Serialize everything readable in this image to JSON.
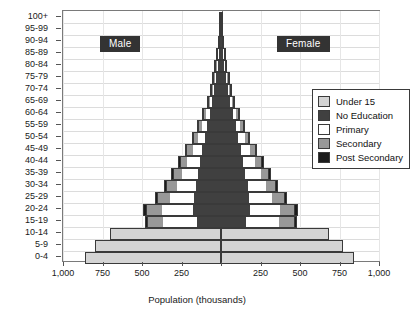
{
  "chart_data": {
    "type": "bar",
    "subtype": "population-pyramid-stacked",
    "title": "",
    "xlabel": "Population (thousands)",
    "ylabel": "",
    "grid": true,
    "legend_position": "upper-right-inside",
    "xlim": [
      -1000,
      1000
    ],
    "x_tick_values": [
      -1000,
      -750,
      -500,
      -250,
      0,
      250,
      500,
      750,
      1000
    ],
    "x_tick_labels": [
      "1,000",
      "750",
      "500",
      "250",
      "",
      "250",
      "500",
      "750",
      "1,000"
    ],
    "side_labels": {
      "left": "Male",
      "right": "Female"
    },
    "categories": [
      "0-4",
      "5-9",
      "10-14",
      "15-19",
      "20-24",
      "25-29",
      "30-34",
      "35-39",
      "40-44",
      "45-49",
      "50-54",
      "55-59",
      "60-64",
      "65-69",
      "70-74",
      "75-79",
      "80-84",
      "85-89",
      "90-94",
      "95-99",
      "100+"
    ],
    "series_order": [
      "Under 15",
      "No Education",
      "Primary",
      "Secondary",
      "Post Secondary"
    ],
    "colors": {
      "Under 15": "#d4d4d4",
      "No Education": "#404040",
      "Primary": "#ffffff",
      "Secondary": "#989898",
      "Post Secondary": "#1c1c1c",
      "outline": "#3a3a3a",
      "axis": "#6e6e6e",
      "grid": "#dcdcdc",
      "banner_bg": "#333333",
      "banner_text": "#ffffff"
    },
    "series": [
      {
        "name": "Under 15",
        "male": [
          862,
          795,
          700,
          0,
          0,
          0,
          0,
          0,
          0,
          0,
          0,
          0,
          0,
          0,
          0,
          0,
          0,
          0,
          0,
          0,
          0
        ],
        "female": [
          840,
          775,
          682,
          0,
          0,
          0,
          0,
          0,
          0,
          0,
          0,
          0,
          0,
          0,
          0,
          0,
          0,
          0,
          0,
          0,
          0
        ]
      },
      {
        "name": "No Education",
        "male": [
          0,
          0,
          0,
          150,
          178,
          172,
          160,
          148,
          135,
          120,
          104,
          88,
          72,
          56,
          42,
          30,
          19,
          11,
          5,
          2,
          1
        ],
        "female": [
          0,
          0,
          0,
          158,
          186,
          180,
          168,
          155,
          141,
          126,
          109,
          92,
          75,
          58,
          44,
          31,
          20,
          11,
          5,
          2,
          1
        ]
      },
      {
        "name": "Primary",
        "male": [
          0,
          0,
          0,
          216,
          196,
          148,
          120,
          100,
          78,
          60,
          44,
          32,
          22,
          14,
          9,
          5,
          3,
          2,
          1,
          0,
          0
        ],
        "female": [
          0,
          0,
          0,
          210,
          190,
          144,
          116,
          96,
          75,
          57,
          42,
          30,
          20,
          13,
          8,
          5,
          3,
          1,
          1,
          0,
          0
        ]
      },
      {
        "name": "Secondary",
        "male": [
          0,
          0,
          0,
          96,
          92,
          76,
          62,
          52,
          42,
          33,
          25,
          18,
          13,
          8,
          5,
          3,
          2,
          1,
          0,
          0,
          0
        ],
        "female": [
          0,
          0,
          0,
          92,
          88,
          72,
          59,
          49,
          40,
          31,
          23,
          17,
          12,
          7,
          5,
          3,
          1,
          1,
          0,
          0,
          0
        ]
      },
      {
        "name": "Post Secondary",
        "male": [
          0,
          0,
          0,
          22,
          26,
          24,
          21,
          18,
          15,
          12,
          9,
          7,
          5,
          3,
          2,
          1,
          1,
          0,
          0,
          0,
          0
        ],
        "female": [
          0,
          0,
          0,
          20,
          24,
          22,
          19,
          17,
          14,
          11,
          8,
          6,
          4,
          3,
          2,
          1,
          0,
          0,
          0,
          0,
          0
        ]
      }
    ],
    "totals": {
      "male": [
        862,
        795,
        700,
        484,
        492,
        420,
        363,
        318,
        270,
        225,
        182,
        145,
        112,
        81,
        58,
        39,
        25,
        14,
        6,
        2,
        1
      ],
      "female": [
        840,
        775,
        682,
        480,
        488,
        418,
        362,
        317,
        270,
        225,
        182,
        145,
        111,
        81,
        59,
        40,
        24,
        13,
        6,
        2,
        1
      ]
    }
  },
  "legend": {
    "items": [
      {
        "label": "Under 15",
        "color": "#d4d4d4"
      },
      {
        "label": "No Education",
        "color": "#404040"
      },
      {
        "label": "Primary",
        "color": "#ffffff"
      },
      {
        "label": "Secondary",
        "color": "#989898"
      },
      {
        "label": "Post Secondary",
        "color": "#1c1c1c"
      }
    ]
  }
}
